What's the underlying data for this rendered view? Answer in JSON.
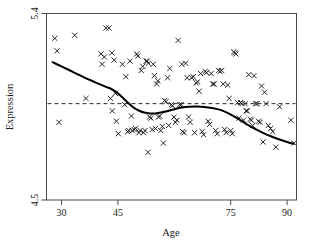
{
  "chart_data": {
    "type": "scatter",
    "title": "",
    "xlabel": "Age",
    "ylabel": "Expression",
    "xlim": [
      26,
      92.5
    ],
    "ylim": [
      4.5,
      5.4
    ],
    "xticks": [
      30,
      45,
      75,
      90
    ],
    "xtick_labels": [
      "30",
      "45",
      "75",
      "90"
    ],
    "yticks": [
      4.5,
      5.4
    ],
    "ytick_labels": [
      "4.5",
      "5.4"
    ],
    "grid": false,
    "legend": "none",
    "marker": "x",
    "marker_color": "#1b1b1b",
    "annotations": [
      {
        "kind": "reference-line",
        "orientation": "horizontal",
        "y": 4.965,
        "style": "dashed"
      },
      {
        "kind": "smoother",
        "label": "loess-curve",
        "style": "solid"
      }
    ],
    "series": [
      {
        "name": "Expression vs Age",
        "points": [
          [
            28.2,
            5.28
          ],
          [
            28.8,
            5.22
          ],
          [
            29.3,
            4.875
          ],
          [
            33.5,
            5.295
          ],
          [
            40.5,
            5.205
          ],
          [
            40.8,
            5.155
          ],
          [
            41.4,
            5.19
          ],
          [
            41.8,
            5.33
          ],
          [
            42.6,
            5.33
          ],
          [
            43.0,
            4.99
          ],
          [
            43.4,
            5.21
          ],
          [
            43.5,
            4.93
          ],
          [
            44.0,
            5.175
          ],
          [
            44.3,
            5.015
          ],
          [
            44.6,
            4.88
          ],
          [
            45.1,
            4.82
          ],
          [
            46.2,
            5.155
          ],
          [
            46.8,
            4.96
          ],
          [
            47.1,
            5.095
          ],
          [
            48.2,
            5.17
          ],
          [
            48.6,
            4.905
          ],
          [
            48.8,
            4.835
          ],
          [
            49.3,
            4.84
          ],
          [
            49.7,
            4.845
          ],
          [
            50.0,
            5.205
          ],
          [
            50.3,
            5.195
          ],
          [
            50.6,
            4.825
          ],
          [
            50.9,
            4.835
          ],
          [
            51.2,
            5.125
          ],
          [
            51.6,
            5.145
          ],
          [
            51.8,
            4.825
          ],
          [
            52.2,
            4.835
          ],
          [
            52.5,
            5.17
          ],
          [
            52.8,
            5.17
          ],
          [
            53.1,
            5.16
          ],
          [
            53.4,
            4.9
          ],
          [
            53.8,
            4.895
          ],
          [
            54.1,
            4.84
          ],
          [
            54.4,
            5.155
          ],
          [
            54.7,
            5.1
          ],
          [
            55.0,
            4.845
          ],
          [
            55.3,
            5.06
          ],
          [
            55.6,
            5.075
          ],
          [
            55.8,
            4.9
          ],
          [
            56.1,
            4.905
          ],
          [
            56.4,
            4.835
          ],
          [
            56.8,
            4.855
          ],
          [
            57.1,
            4.775
          ],
          [
            57.4,
            4.98
          ],
          [
            57.8,
            4.975
          ],
          [
            58.2,
            5.09
          ],
          [
            58.5,
            4.86
          ],
          [
            58.8,
            5.135
          ],
          [
            59.2,
            4.96
          ],
          [
            59.5,
            4.955
          ],
          [
            59.9,
            4.9
          ],
          [
            60.3,
            4.875
          ],
          [
            60.7,
            4.885
          ],
          [
            61.0,
            5.27
          ],
          [
            61.4,
            4.96
          ],
          [
            61.8,
            4.96
          ],
          [
            62.2,
            4.83
          ],
          [
            62.6,
            4.825
          ],
          [
            63.0,
            5.16
          ],
          [
            63.4,
            5.09
          ],
          [
            63.8,
            4.9
          ],
          [
            64.2,
            4.875
          ],
          [
            64.6,
            5.09
          ],
          [
            65.0,
            5.095
          ],
          [
            65.4,
            4.825
          ],
          [
            65.8,
            5.065
          ],
          [
            66.2,
            5.07
          ],
          [
            66.6,
            5.025
          ],
          [
            67.0,
            5.11
          ],
          [
            67.4,
            4.83
          ],
          [
            67.8,
            4.815
          ],
          [
            68.2,
            5.12
          ],
          [
            68.6,
            5.115
          ],
          [
            69.0,
            4.88
          ],
          [
            69.4,
            4.865
          ],
          [
            69.8,
            5.11
          ],
          [
            70.2,
            5.06
          ],
          [
            70.6,
            5.06
          ],
          [
            71.0,
            4.835
          ],
          [
            71.4,
            4.82
          ],
          [
            71.8,
            5.125
          ],
          [
            72.2,
            5.12
          ],
          [
            72.6,
            5.125
          ],
          [
            73.0,
            5.06
          ],
          [
            73.4,
            4.84
          ],
          [
            73.8,
            4.825
          ],
          [
            74.2,
            5.055
          ],
          [
            74.6,
            4.99
          ],
          [
            75.0,
            4.835
          ],
          [
            75.4,
            4.82
          ],
          [
            75.8,
            5.215
          ],
          [
            76.1,
            5.21
          ],
          [
            76.4,
            5.205
          ],
          [
            76.8,
            4.97
          ],
          [
            77.2,
            4.895
          ],
          [
            77.6,
            4.97
          ],
          [
            78.0,
            4.965
          ],
          [
            78.4,
            4.885
          ],
          [
            78.8,
            4.965
          ],
          [
            79.1,
            4.93
          ],
          [
            79.4,
            4.93
          ],
          [
            79.8,
            5.105
          ],
          [
            80.2,
            4.89
          ],
          [
            80.5,
            4.885
          ],
          [
            80.8,
            4.86
          ],
          [
            81.2,
            5.1
          ],
          [
            81.6,
            4.965
          ],
          [
            82.0,
            4.965
          ],
          [
            82.4,
            4.88
          ],
          [
            82.8,
            4.875
          ],
          [
            83.2,
            5.05
          ],
          [
            83.6,
            4.78
          ],
          [
            84.0,
            5.02
          ],
          [
            84.4,
            4.965
          ],
          [
            85.0,
            4.86
          ],
          [
            85.6,
            4.845
          ],
          [
            86.2,
            4.83
          ],
          [
            87.0,
            4.755
          ],
          [
            88.0,
            4.95
          ],
          [
            91.0,
            4.885
          ],
          [
            91.8,
            4.775
          ],
          [
            47.6,
            4.83
          ],
          [
            47.9,
            4.835
          ],
          [
            53.0,
            4.73
          ],
          [
            62.0,
            5.155
          ],
          [
            36.5,
            4.99
          ]
        ]
      }
    ],
    "smooth_curve": [
      [
        27.6,
        5.165
      ],
      [
        30.0,
        5.145
      ],
      [
        33.0,
        5.118
      ],
      [
        36.0,
        5.092
      ],
      [
        39.0,
        5.068
      ],
      [
        41.5,
        5.048
      ],
      [
        43.0,
        5.038
      ],
      [
        44.5,
        5.022
      ],
      [
        46.0,
        4.998
      ],
      [
        47.5,
        4.972
      ],
      [
        49.0,
        4.948
      ],
      [
        50.5,
        4.932
      ],
      [
        52.0,
        4.922
      ],
      [
        53.5,
        4.9175
      ],
      [
        55.0,
        4.918
      ],
      [
        56.5,
        4.922
      ],
      [
        58.0,
        4.9285
      ],
      [
        60.0,
        4.938
      ],
      [
        62.0,
        4.946
      ],
      [
        64.0,
        4.95
      ],
      [
        66.0,
        4.951
      ],
      [
        68.0,
        4.949
      ],
      [
        70.0,
        4.944
      ],
      [
        72.0,
        4.936
      ],
      [
        74.0,
        4.922
      ],
      [
        76.0,
        4.902
      ],
      [
        78.0,
        4.88
      ],
      [
        80.0,
        4.858
      ],
      [
        82.0,
        4.838
      ],
      [
        84.0,
        4.82
      ],
      [
        86.0,
        4.805
      ],
      [
        88.0,
        4.792
      ],
      [
        90.0,
        4.78
      ],
      [
        91.8,
        4.771
      ]
    ],
    "reference_line_y": 4.965
  },
  "axes": {
    "x_title": "Age",
    "y_title": "Expression"
  }
}
